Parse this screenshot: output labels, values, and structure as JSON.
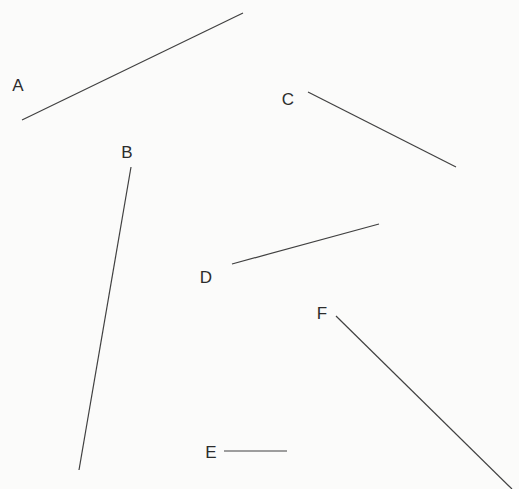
{
  "figure": {
    "background_color": "#fbfbfa",
    "stroke_color": "#404040",
    "label_color": "#2c2c2c",
    "stroke_width": 1.2,
    "width": 519,
    "height": 489
  },
  "chart_data": {
    "type": "line",
    "title": "",
    "subtitle": "",
    "xlabel": "",
    "ylabel": "",
    "grid": false,
    "legend_position": "none",
    "xlim": [
      0,
      519
    ],
    "ylim": [
      489,
      0
    ],
    "series": [
      {
        "name": "A",
        "label": "A",
        "x": [
          22,
          243
        ],
        "y": [
          120,
          13
        ],
        "x1": 22,
        "y1": 120,
        "x2": 243,
        "y2": 13,
        "length_px": 245,
        "angle_deg": 25.8,
        "label_x": 18,
        "label_y": 85
      },
      {
        "name": "B",
        "label": "B",
        "x": [
          131,
          79
        ],
        "y": [
          167,
          470
        ],
        "x1": 131,
        "y1": 167,
        "x2": 79,
        "y2": 470,
        "length_px": 307,
        "angle_deg": -99.7,
        "label_x": 127,
        "label_y": 152
      },
      {
        "name": "C",
        "label": "C",
        "x": [
          308,
          456
        ],
        "y": [
          92,
          167
        ],
        "x1": 308,
        "y1": 92,
        "x2": 456,
        "y2": 167,
        "length_px": 166,
        "angle_deg": -26.9,
        "label_x": 288,
        "label_y": 99
      },
      {
        "name": "D",
        "label": "D",
        "x": [
          232,
          379
        ],
        "y": [
          264,
          224
        ],
        "x1": 232,
        "y1": 264,
        "x2": 379,
        "y2": 224,
        "length_px": 152,
        "angle_deg": 15.2,
        "label_x": 206,
        "label_y": 277
      },
      {
        "name": "E",
        "label": "E",
        "x": [
          224,
          287
        ],
        "y": [
          451,
          451
        ],
        "x1": 224,
        "y1": 451,
        "x2": 287,
        "y2": 451,
        "length_px": 63,
        "angle_deg": 0.0,
        "label_x": 211,
        "label_y": 452
      },
      {
        "name": "F",
        "label": "F",
        "x": [
          336,
          512
        ],
        "y": [
          316,
          489
        ],
        "x1": 336,
        "y1": 316,
        "x2": 512,
        "y2": 489,
        "length_px": 247,
        "angle_deg": -44.5,
        "label_x": 322,
        "label_y": 313
      }
    ]
  }
}
